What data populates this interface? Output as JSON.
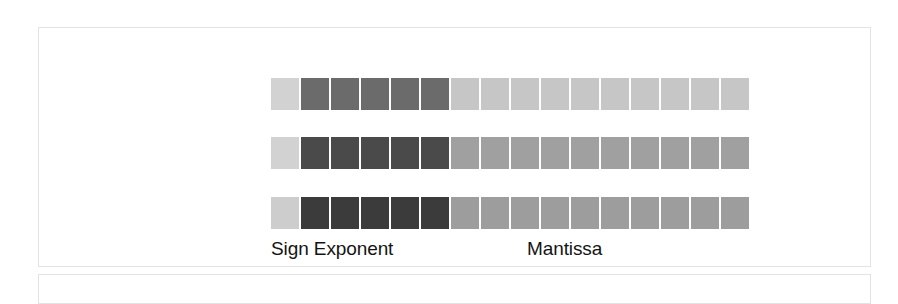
{
  "figure": {
    "name": "floating-point-bit-layout",
    "panel_border_color": "#e3e3e3",
    "background_color": "#ffffff",
    "labels": {
      "sign_exponent": "Sign Exponent",
      "mantissa": "Mantissa",
      "label_color": "#141414"
    },
    "bitfield": {
      "total_cells": 16,
      "field_spans": {
        "sign": 1,
        "exponent": 5,
        "mantissa": 10
      },
      "rows": [
        {
          "row_index": 0,
          "name": "row-top",
          "cells": [
            {
              "field": "sign",
              "color": "#d2d2d2"
            },
            {
              "field": "exponent",
              "color": "#6b6b6b"
            },
            {
              "field": "exponent",
              "color": "#6b6b6b"
            },
            {
              "field": "exponent",
              "color": "#6b6b6b"
            },
            {
              "field": "exponent",
              "color": "#6b6b6b"
            },
            {
              "field": "exponent",
              "color": "#6b6b6b"
            },
            {
              "field": "mantissa",
              "color": "#c6c6c6"
            },
            {
              "field": "mantissa",
              "color": "#c6c6c6"
            },
            {
              "field": "mantissa",
              "color": "#c6c6c6"
            },
            {
              "field": "mantissa",
              "color": "#c6c6c6"
            },
            {
              "field": "mantissa",
              "color": "#c6c6c6"
            },
            {
              "field": "mantissa",
              "color": "#c6c6c6"
            },
            {
              "field": "mantissa",
              "color": "#c6c6c6"
            },
            {
              "field": "mantissa",
              "color": "#c6c6c6"
            },
            {
              "field": "mantissa",
              "color": "#c6c6c6"
            },
            {
              "field": "mantissa",
              "color": "#c6c6c6"
            }
          ]
        },
        {
          "row_index": 1,
          "name": "row-middle",
          "cells": [
            {
              "field": "sign",
              "color": "#d2d2d2"
            },
            {
              "field": "exponent",
              "color": "#4a4a4a"
            },
            {
              "field": "exponent",
              "color": "#4a4a4a"
            },
            {
              "field": "exponent",
              "color": "#4a4a4a"
            },
            {
              "field": "exponent",
              "color": "#4a4a4a"
            },
            {
              "field": "exponent",
              "color": "#4a4a4a"
            },
            {
              "field": "mantissa",
              "color": "#a0a0a0"
            },
            {
              "field": "mantissa",
              "color": "#a0a0a0"
            },
            {
              "field": "mantissa",
              "color": "#a0a0a0"
            },
            {
              "field": "mantissa",
              "color": "#a0a0a0"
            },
            {
              "field": "mantissa",
              "color": "#a0a0a0"
            },
            {
              "field": "mantissa",
              "color": "#a0a0a0"
            },
            {
              "field": "mantissa",
              "color": "#a0a0a0"
            },
            {
              "field": "mantissa",
              "color": "#a0a0a0"
            },
            {
              "field": "mantissa",
              "color": "#a0a0a0"
            },
            {
              "field": "mantissa",
              "color": "#a0a0a0"
            }
          ]
        },
        {
          "row_index": 2,
          "name": "row-bottom",
          "cells": [
            {
              "field": "sign",
              "color": "#cdcdcd"
            },
            {
              "field": "exponent",
              "color": "#3b3b3b"
            },
            {
              "field": "exponent",
              "color": "#3b3b3b"
            },
            {
              "field": "exponent",
              "color": "#3b3b3b"
            },
            {
              "field": "exponent",
              "color": "#3b3b3b"
            },
            {
              "field": "exponent",
              "color": "#3b3b3b"
            },
            {
              "field": "mantissa",
              "color": "#9d9d9d"
            },
            {
              "field": "mantissa",
              "color": "#9d9d9d"
            },
            {
              "field": "mantissa",
              "color": "#9d9d9d"
            },
            {
              "field": "mantissa",
              "color": "#9d9d9d"
            },
            {
              "field": "mantissa",
              "color": "#9d9d9d"
            },
            {
              "field": "mantissa",
              "color": "#9d9d9d"
            },
            {
              "field": "mantissa",
              "color": "#9d9d9d"
            },
            {
              "field": "mantissa",
              "color": "#9d9d9d"
            },
            {
              "field": "mantissa",
              "color": "#9d9d9d"
            },
            {
              "field": "mantissa",
              "color": "#9d9d9d"
            }
          ]
        }
      ]
    }
  }
}
